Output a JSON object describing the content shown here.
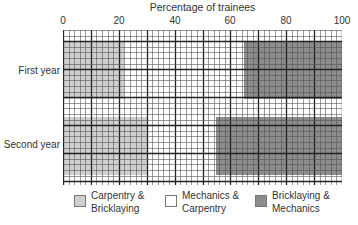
{
  "chart_data": {
    "type": "bar",
    "orientation": "horizontal",
    "stacked": true,
    "title": "Percentage of trainees",
    "xlabel": "Percentage of trainees",
    "ylabel": "",
    "xlim": [
      0,
      100
    ],
    "x_ticks": [
      "0",
      "20",
      "40",
      "60",
      "80",
      "100"
    ],
    "grid": true,
    "categories": [
      "First year",
      "Second year"
    ],
    "series": [
      {
        "name": "Carpentry & Bricklaying",
        "color": "#cfcfcf",
        "values": [
          22,
          30
        ]
      },
      {
        "name": "Mechanics & Carpentry",
        "color": "#ffffff",
        "values": [
          43,
          25
        ]
      },
      {
        "name": "Bricklaying & Mechanics",
        "color": "#8c8c8c",
        "values": [
          35,
          45
        ]
      }
    ],
    "legend": {
      "position": "bottom",
      "entries": [
        {
          "line1": "Carpentry &",
          "line2": "Bricklaying",
          "color": "#cfcfcf"
        },
        {
          "line1": "Mechanics &",
          "line2": "Carpentry",
          "color": "#ffffff"
        },
        {
          "line1": "Bricklaying &",
          "line2": "Mechanics",
          "color": "#8c8c8c"
        }
      ]
    }
  }
}
